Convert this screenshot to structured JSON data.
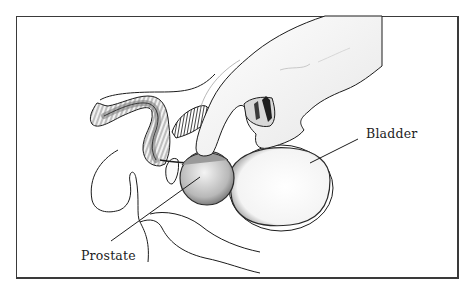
{
  "figure": {
    "type": "anatomical illustration",
    "frame_color": "#3a3a3a",
    "line_color": "#1c1c1c",
    "labels": [
      {
        "id": "bladder",
        "text": "Bladder"
      },
      {
        "id": "prostate",
        "text": "Prostate"
      }
    ],
    "parts": [
      "gloved finger / hand",
      "rectum",
      "prostate",
      "bladder",
      "pubic bone",
      "seminal vesicle",
      "urethra",
      "penis"
    ]
  }
}
